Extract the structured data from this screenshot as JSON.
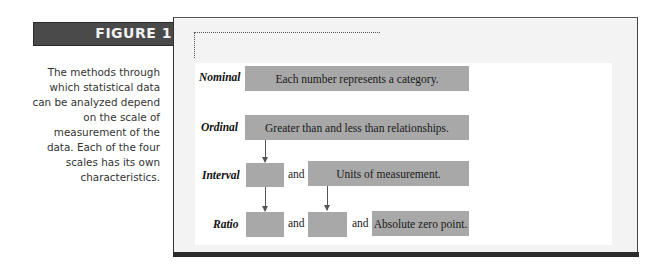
{
  "figure": {
    "label": "FIGURE 1.2",
    "caption": "The methods through which statistical data can be analyzed depend on the scale of measurement of the data. Each of the four scales has its own characteristics.",
    "caption_lines": [
      "The methods through",
      "which statistical data",
      "can be analyzed depend",
      "on the scale of",
      "measurement of the",
      "data. Each of the four",
      "scales has its own",
      "characteristics."
    ]
  },
  "diagram": {
    "rows": [
      {
        "label": "Nominal",
        "boxes": [
          "Each number represents a category."
        ]
      },
      {
        "label": "Ordinal",
        "boxes": [
          "Greater than and less than relationships."
        ]
      },
      {
        "label": "Interval",
        "boxes": [
          "",
          "Units of measurement."
        ],
        "connector": "and"
      },
      {
        "label": "Ratio",
        "boxes": [
          "",
          "",
          "Absolute zero point."
        ],
        "connectors": [
          "and",
          "and"
        ]
      }
    ],
    "connector_text": "and",
    "colors": {
      "box_fill": "#a8a8a8",
      "header_fill": "#4a4a4a",
      "frame_bg": "#f3f3f3",
      "panel_bg": "#ffffff"
    }
  }
}
